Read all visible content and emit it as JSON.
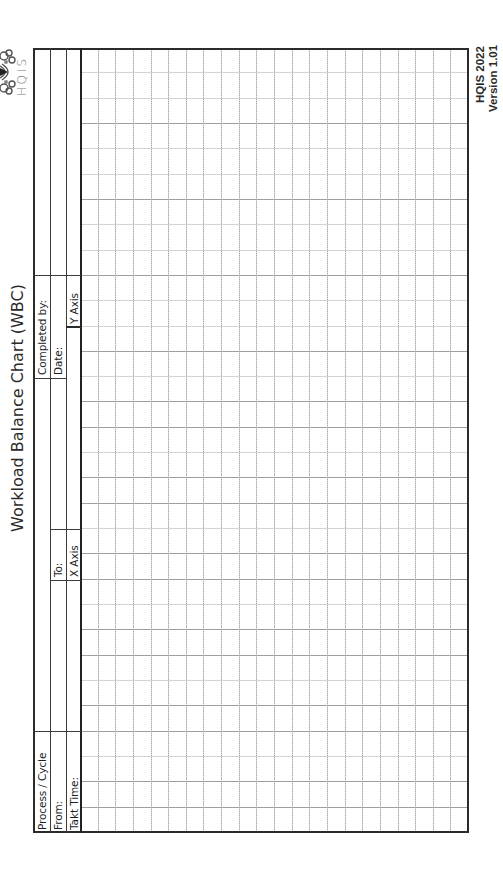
{
  "document": {
    "title": "Workload Balance Chart (WBC)",
    "orientation": "rotated-90-ccw",
    "logo": {
      "text": "HQIS",
      "icon": "knot-flower-logo-icon"
    },
    "footer": {
      "line1": "HQIS 2022",
      "line2": "Version 1.01"
    }
  },
  "header_fields": {
    "process_cycle": {
      "label": "Process / Cycle",
      "value": ""
    },
    "from": {
      "label": "From:",
      "value": ""
    },
    "to": {
      "label": "To:",
      "value": ""
    },
    "takt_time": {
      "label": "Takt Time:",
      "value": ""
    },
    "x_axis": {
      "label": "X Axis",
      "value": ""
    },
    "completed_by": {
      "label": "Completed by:",
      "value": ""
    },
    "date": {
      "label": "Date:",
      "value": ""
    },
    "y_axis": {
      "label": "Y Axis",
      "value": ""
    }
  },
  "grid": {
    "columns": 22,
    "rows": 31,
    "line_style": "dotted",
    "line_color": "#9a9a9a",
    "border_color": "#2b2b2b"
  }
}
